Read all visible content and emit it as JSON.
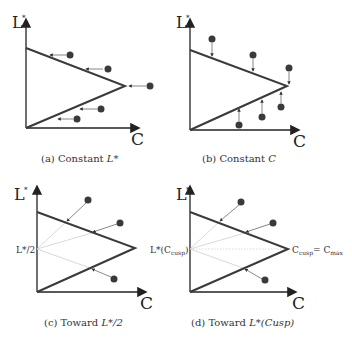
{
  "figure": {
    "axis_labels": {
      "y": "L*",
      "x": "C"
    },
    "colors": {
      "boundary": "#3a3a3a",
      "dot": "#3a3a3a",
      "guide": "#c8c8c8",
      "arrow": "#555555"
    },
    "panels": [
      {
        "id": "a",
        "caption_prefix": "(a) Constant",
        "caption_math": "L*"
      },
      {
        "id": "b",
        "caption_prefix": "(b) Constant",
        "caption_math": "C"
      },
      {
        "id": "c",
        "caption_prefix": "(c) Toward",
        "caption_math": "L*/2",
        "mid_label": "L*/2"
      },
      {
        "id": "d",
        "caption_prefix": "(d) Toward",
        "caption_math": "L*(Cusp)",
        "mid_label": "L*(Ccusp)",
        "apex_label": "Ccusp = Cmax"
      }
    ]
  }
}
